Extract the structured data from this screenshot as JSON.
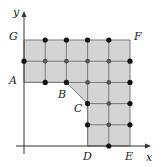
{
  "diagram": {
    "type": "coordinate-grid-region",
    "axes": {
      "x_label": "x",
      "y_label": "y",
      "origin_px": [
        24,
        146
      ],
      "x_arrow_tip_px": [
        151,
        146
      ],
      "y_arrow_tip_px": [
        24,
        11
      ]
    },
    "grid_unit_px": 21.2,
    "region": {
      "fill": "#d4d4d4",
      "stroke": "#7a7a7a",
      "vertices": [
        {
          "name": "G",
          "grid": [
            0,
            5
          ]
        },
        {
          "name": "F",
          "grid": [
            5,
            5
          ]
        },
        {
          "name": "E",
          "grid": [
            5,
            0
          ]
        },
        {
          "name": "D",
          "grid": [
            3,
            0
          ]
        },
        {
          "name": "C",
          "grid": [
            3,
            2
          ]
        },
        {
          "name": "B",
          "grid": [
            2,
            3
          ]
        },
        {
          "name": "A",
          "grid": [
            0,
            3
          ]
        }
      ]
    },
    "labels": [
      {
        "text": "G",
        "x": 9,
        "y": 40
      },
      {
        "text": "F",
        "x": 134,
        "y": 40
      },
      {
        "text": "A",
        "x": 9,
        "y": 84
      },
      {
        "text": "B",
        "x": 58,
        "y": 98
      },
      {
        "text": "C",
        "x": 74,
        "y": 112
      },
      {
        "text": "D",
        "x": 83,
        "y": 160
      },
      {
        "text": "E",
        "x": 125,
        "y": 160
      },
      {
        "text": "x",
        "x": 146,
        "y": 161
      },
      {
        "text": "y",
        "x": 13,
        "y": 16
      }
    ],
    "boundary_points": [
      [
        1,
        5
      ],
      [
        2,
        5
      ],
      [
        3,
        5
      ],
      [
        4,
        5
      ],
      [
        0,
        4
      ],
      [
        5,
        4
      ],
      [
        1,
        3
      ],
      [
        2,
        3
      ],
      [
        5,
        3
      ],
      [
        3,
        2
      ],
      [
        5,
        2
      ],
      [
        3,
        1
      ],
      [
        5,
        1
      ],
      [
        4,
        0
      ]
    ],
    "interior_points": [
      [
        1,
        4
      ],
      [
        2,
        4
      ],
      [
        3,
        4
      ],
      [
        4,
        4
      ],
      [
        3,
        3
      ],
      [
        4,
        3
      ],
      [
        4,
        2
      ],
      [
        4,
        1
      ]
    ],
    "colors": {
      "boundary_dot": "#111111",
      "interior_dot": "#555555",
      "axis": "#333333",
      "grid_line": "#7a7a7a"
    }
  }
}
